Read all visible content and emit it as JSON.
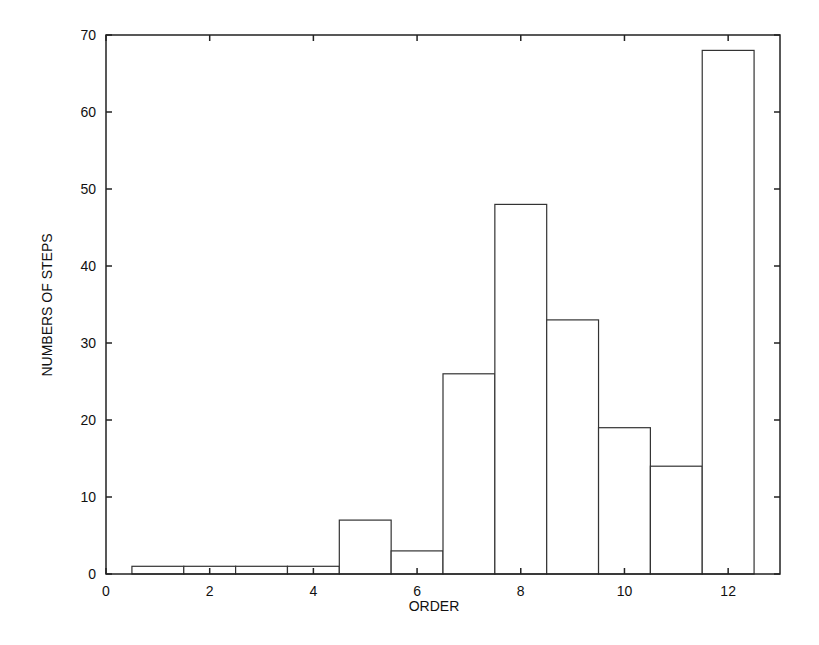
{
  "chart_data": {
    "type": "bar",
    "title": "",
    "xlabel": "ORDER",
    "ylabel": "NUMBERS OF STEPS",
    "categories": [
      1,
      2,
      3,
      4,
      5,
      6,
      7,
      8,
      9,
      10,
      11,
      12
    ],
    "values": [
      1,
      1,
      1,
      1,
      7,
      3,
      26,
      48,
      33,
      19,
      14,
      68
    ],
    "xlim": [
      0,
      13
    ],
    "ylim": [
      0,
      70
    ],
    "xticks": [
      0,
      2,
      4,
      6,
      8,
      10,
      12
    ],
    "yticks": [
      0,
      10,
      20,
      30,
      40,
      50,
      60,
      70
    ],
    "grid": false,
    "legend": null,
    "bar_fill": "#ffffff",
    "bar_edge": "#333333"
  }
}
